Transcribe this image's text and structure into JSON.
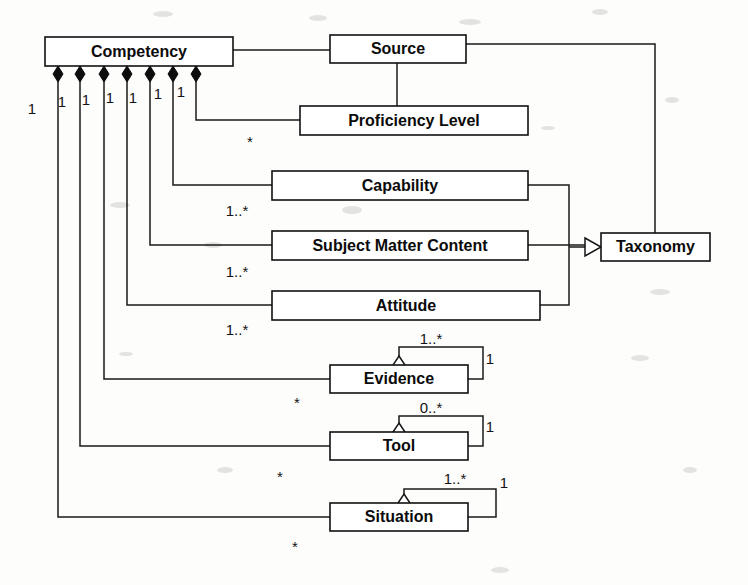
{
  "diagram": {
    "type": "uml-class-diagram",
    "background_color": "#fdfdfc",
    "line_color": "#1a1a1a",
    "box_fill": "#ffffff",
    "text_color": "#0b0b0b",
    "classes": [
      {
        "id": "competency",
        "name": "Competency",
        "x": 45,
        "y": 37,
        "w": 188,
        "h": 29
      },
      {
        "id": "source",
        "name": "Source",
        "x": 330,
        "y": 35,
        "w": 136,
        "h": 28
      },
      {
        "id": "proficiency",
        "name": "Proficiency Level",
        "x": 300,
        "y": 106,
        "w": 228,
        "h": 29
      },
      {
        "id": "capability",
        "name": "Capability",
        "x": 272,
        "y": 171,
        "w": 256,
        "h": 29
      },
      {
        "id": "smc",
        "name": "Subject Matter Content",
        "x": 272,
        "y": 231,
        "w": 256,
        "h": 29
      },
      {
        "id": "attitude",
        "name": "Attitude",
        "x": 272,
        "y": 291,
        "w": 268,
        "h": 29
      },
      {
        "id": "taxonomy",
        "name": "Taxonomy",
        "x": 601,
        "y": 233,
        "w": 109,
        "h": 28
      },
      {
        "id": "evidence",
        "name": "Evidence",
        "x": 330,
        "y": 365,
        "w": 138,
        "h": 28
      },
      {
        "id": "tool",
        "name": "Tool",
        "x": 330,
        "y": 432,
        "w": 138,
        "h": 28
      },
      {
        "id": "situation",
        "name": "Situation",
        "x": 330,
        "y": 503,
        "w": 138,
        "h": 28
      }
    ],
    "composition_ends": [
      {
        "index": 0,
        "x": 58,
        "multiplicity": "1",
        "target": "situation"
      },
      {
        "index": 1,
        "x": 80,
        "multiplicity": "1",
        "target": "tool"
      },
      {
        "index": 2,
        "x": 104,
        "multiplicity": "1",
        "target": "evidence"
      },
      {
        "index": 3,
        "x": 127,
        "multiplicity": "1",
        "target": "attitude"
      },
      {
        "index": 4,
        "x": 150,
        "multiplicity": "1",
        "target": "smc"
      },
      {
        "index": 5,
        "x": 173,
        "multiplicity": "1",
        "target": "capability"
      },
      {
        "index": 6,
        "x": 196,
        "multiplicity": "1",
        "target": "proficiency"
      }
    ],
    "far_multiplicities": [
      {
        "label": "*",
        "x": 250,
        "y": 143,
        "for": "proficiency"
      },
      {
        "label": "1..*",
        "x": 237,
        "y": 212,
        "for": "capability"
      },
      {
        "label": "1..*",
        "x": 237,
        "y": 273,
        "for": "smc"
      },
      {
        "label": "1..*",
        "x": 237,
        "y": 331,
        "for": "attitude"
      },
      {
        "label": "*",
        "x": 297,
        "y": 404,
        "for": "evidence"
      },
      {
        "label": "*",
        "x": 280,
        "y": 478,
        "for": "tool"
      },
      {
        "label": "*",
        "x": 295,
        "y": 548,
        "for": "situation"
      }
    ],
    "self_associations": [
      {
        "on": "evidence",
        "near_label": "1..*",
        "far_label": "1",
        "near_x": 431,
        "near_y": 340,
        "far_x": 490,
        "far_y": 360
      },
      {
        "on": "tool",
        "near_label": "0..*",
        "far_label": "1",
        "near_x": 431,
        "near_y": 410,
        "far_x": 490,
        "far_y": 428
      },
      {
        "on": "situation",
        "near_label": "1..*",
        "far_label": "1",
        "near_x": 455,
        "near_y": 480,
        "far_x": 504,
        "far_y": 483
      }
    ],
    "generalizations": [
      {
        "from": "capability",
        "to": "taxonomy",
        "arrow": "hollow-triangle"
      },
      {
        "from": "smc",
        "to": "taxonomy",
        "arrow": "hollow-triangle"
      },
      {
        "from": "attitude",
        "to": "taxonomy",
        "arrow": "hollow-triangle"
      }
    ],
    "plain_associations": [
      {
        "from": "competency",
        "to": "source",
        "style": "horizontal"
      },
      {
        "from": "source",
        "to": "proficiency",
        "style": "vertical-drop"
      },
      {
        "from": "source",
        "to": "taxonomy",
        "style": "right-elbow"
      }
    ]
  }
}
